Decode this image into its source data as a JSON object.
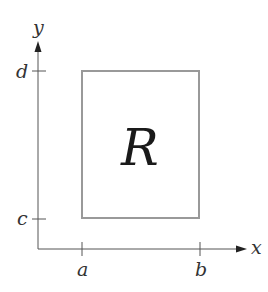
{
  "diagram": {
    "region_label": "R",
    "axes": {
      "x_label": "x",
      "y_label": "y"
    },
    "ticks": {
      "x": [
        {
          "label": "a"
        },
        {
          "label": "b"
        }
      ],
      "y": [
        {
          "label": "c"
        },
        {
          "label": "d"
        }
      ]
    },
    "colors": {
      "axis": "#555555",
      "rect_stroke": "#999999",
      "text": "#222222"
    }
  }
}
